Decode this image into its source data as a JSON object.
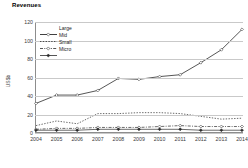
{
  "chart_data": {
    "type": "line",
    "title": "Revenues",
    "xlabel": "",
    "ylabel": "US$b",
    "categories": [
      "2004",
      "2005",
      "2006",
      "2007",
      "2008",
      "2009",
      "2010",
      "2011",
      "2012",
      "2013",
      "2014"
    ],
    "ylim": [
      0,
      120
    ],
    "yticks": [
      0,
      20,
      40,
      60,
      80,
      100,
      120
    ],
    "grid": true,
    "legend_position": "top-left",
    "series": [
      {
        "name": "Large",
        "style": "solid-diamond",
        "values": [
          32,
          41,
          41,
          46,
          59,
          58,
          61,
          63,
          76,
          90,
          112
        ]
      },
      {
        "name": "Mid",
        "style": "dotted",
        "values": [
          8,
          13,
          10,
          21,
          21,
          22,
          22,
          21,
          18,
          15,
          16
        ]
      },
      {
        "name": "Small",
        "style": "dash-dot",
        "values": [
          4,
          5,
          5,
          6,
          6,
          6,
          7,
          8,
          7,
          7,
          7
        ]
      },
      {
        "name": "Micro",
        "style": "solid-marker",
        "values": [
          3,
          3,
          3,
          4,
          4,
          4,
          4,
          4,
          3,
          3,
          3
        ]
      }
    ]
  }
}
